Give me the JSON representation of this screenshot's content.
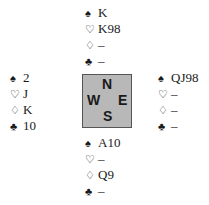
{
  "symbols": {
    "spades": "♠",
    "hearts": "♡",
    "diamonds": "♢",
    "clubs": "♣"
  },
  "hands": {
    "north": {
      "spades": "K",
      "hearts": "K98",
      "diamonds": "–",
      "clubs": "–"
    },
    "west": {
      "spades": "2",
      "hearts": "J",
      "diamonds": "K",
      "clubs": "10"
    },
    "east": {
      "spades": "QJ98",
      "hearts": "–",
      "diamonds": "–",
      "clubs": "–"
    },
    "south": {
      "spades": "A10",
      "hearts": "–",
      "diamonds": "Q9",
      "clubs": "–"
    }
  },
  "compass": {
    "n": "N",
    "w": "W",
    "e": "E",
    "s": "S"
  },
  "colors": {
    "compass_bg": "#b8b8b8",
    "text": "#1a1a1a"
  }
}
